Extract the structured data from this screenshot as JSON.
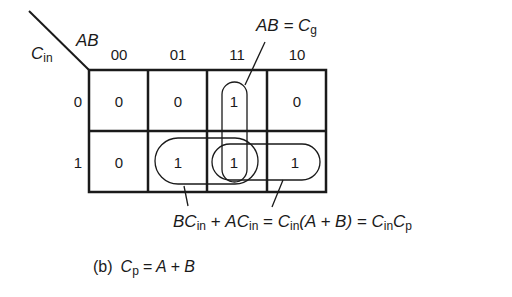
{
  "figure": {
    "caption_label": "(b)",
    "caption_lhs_main": "C",
    "caption_lhs_sub": "p",
    "caption_rhs": "= A + B"
  },
  "kmap": {
    "row_var_main": "C",
    "row_var_sub": "in",
    "col_var": "AB",
    "col_headers": [
      "00",
      "01",
      "11",
      "10"
    ],
    "row_headers": [
      "0",
      "1"
    ],
    "cells": [
      [
        "0",
        "0",
        "1",
        "0"
      ],
      [
        "0",
        "1",
        "1",
        "1"
      ]
    ]
  },
  "annotations": {
    "top_label_main": "AB = C",
    "top_label_sub": "g",
    "bottom_expr": {
      "t1_main": "BC",
      "t1_sub": "in",
      "plus": " + ",
      "t2_main": "AC",
      "t2_sub": "in",
      "eq1": " = ",
      "t3_main": "C",
      "t3_sub": "in",
      "t3_rest": "(A + B) = ",
      "t4_main": "C",
      "t4_sub": "in",
      "t5_main": "C",
      "t5_sub": "p"
    }
  },
  "colors": {
    "ink": "#1a1a1a",
    "background": "#ffffff"
  }
}
